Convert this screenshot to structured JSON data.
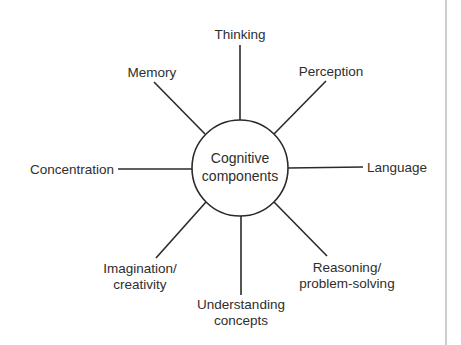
{
  "diagram": {
    "center": {
      "line1": "Cognitive",
      "line2": "components"
    },
    "nodes": {
      "thinking": {
        "lines": [
          "Thinking"
        ]
      },
      "perception": {
        "lines": [
          "Perception"
        ]
      },
      "language": {
        "lines": [
          "Language"
        ]
      },
      "reasoning": {
        "lines": [
          "Reasoning/",
          "problem-solving"
        ]
      },
      "understanding": {
        "lines": [
          "Understanding",
          "concepts"
        ]
      },
      "imagination": {
        "lines": [
          "Imagination/",
          "creativity"
        ]
      },
      "concentration": {
        "lines": [
          "Concentration"
        ]
      },
      "memory": {
        "lines": [
          "Memory"
        ]
      }
    }
  }
}
